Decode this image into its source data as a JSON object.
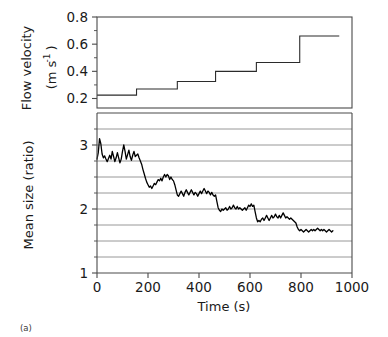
{
  "figure": {
    "caption": "(a)",
    "background_color": "#ffffff",
    "line_color": "#2b2b2b",
    "grid_color": "#8c8c8c",
    "axis_color": "#4a4a4a"
  },
  "chart_data": [
    {
      "type": "line",
      "id": "flow-velocity-panel",
      "title": "",
      "xlabel": "",
      "ylabel": "Flow velocity (m s⁻¹)",
      "ylabel_line1": "Flow velocity",
      "ylabel_line2": "(m s",
      "ylabel_exponent": "-1",
      "ylabel_line2_close": ")",
      "ytick_labels": [
        "0.2",
        "0.4",
        "0.6",
        "0.8"
      ],
      "ytick_values": [
        0.2,
        0.4,
        0.6,
        0.8
      ],
      "ylim": [
        0.13,
        0.8
      ],
      "xlim": [
        0,
        1000
      ],
      "grid": false,
      "step_style": "post",
      "x": [
        0,
        155,
        155,
        315,
        315,
        465,
        465,
        625,
        625,
        795,
        795,
        950
      ],
      "y": [
        0.225,
        0.225,
        0.27,
        0.27,
        0.325,
        0.325,
        0.4,
        0.4,
        0.465,
        0.465,
        0.66,
        0.66
      ],
      "steps": [
        {
          "x_start": 0,
          "x_end": 155,
          "velocity": 0.225
        },
        {
          "x_start": 155,
          "x_end": 315,
          "velocity": 0.27
        },
        {
          "x_start": 315,
          "x_end": 465,
          "velocity": 0.325
        },
        {
          "x_start": 465,
          "x_end": 625,
          "velocity": 0.4
        },
        {
          "x_start": 625,
          "x_end": 795,
          "velocity": 0.465
        },
        {
          "x_start": 795,
          "x_end": 950,
          "velocity": 0.66
        }
      ]
    },
    {
      "type": "line",
      "id": "mean-size-panel",
      "title": "",
      "xlabel": "Time (s)",
      "ylabel": "Mean size (ratio)",
      "ytick_labels": [
        "1",
        "2",
        "3"
      ],
      "ytick_values": [
        1,
        2,
        3
      ],
      "xtick_labels": [
        "0",
        "200",
        "400",
        "600",
        "800",
        "1000"
      ],
      "xtick_values": [
        0,
        200,
        400,
        600,
        800,
        1000
      ],
      "ylim": [
        1.0,
        3.5
      ],
      "xlim": [
        0,
        1000
      ],
      "grid": true,
      "grid_values": [
        1.25,
        1.5,
        1.75,
        2.0,
        2.25,
        2.5,
        2.75,
        3.0,
        3.25,
        3.5
      ],
      "x": [
        0,
        5,
        10,
        15,
        20,
        25,
        30,
        35,
        40,
        45,
        50,
        55,
        60,
        65,
        70,
        75,
        80,
        85,
        90,
        95,
        100,
        105,
        110,
        115,
        120,
        125,
        130,
        135,
        140,
        145,
        150,
        155,
        160,
        165,
        170,
        175,
        180,
        185,
        190,
        195,
        200,
        205,
        210,
        215,
        220,
        225,
        230,
        235,
        240,
        245,
        250,
        255,
        260,
        265,
        270,
        275,
        280,
        285,
        290,
        295,
        300,
        305,
        310,
        315,
        320,
        325,
        330,
        335,
        340,
        345,
        350,
        355,
        360,
        365,
        370,
        375,
        380,
        385,
        390,
        395,
        400,
        405,
        410,
        415,
        420,
        425,
        430,
        435,
        440,
        445,
        450,
        455,
        460,
        465,
        470,
        475,
        480,
        485,
        490,
        495,
        500,
        505,
        510,
        515,
        520,
        525,
        530,
        535,
        540,
        545,
        550,
        555,
        560,
        565,
        570,
        575,
        580,
        585,
        590,
        595,
        600,
        605,
        610,
        615,
        620,
        625,
        630,
        635,
        640,
        645,
        650,
        655,
        660,
        665,
        670,
        675,
        680,
        685,
        690,
        695,
        700,
        705,
        710,
        715,
        720,
        725,
        730,
        735,
        740,
        745,
        750,
        755,
        760,
        765,
        770,
        775,
        780,
        785,
        790,
        795,
        800,
        805,
        810,
        815,
        820,
        825,
        830,
        835,
        840,
        845,
        850,
        855,
        860,
        865,
        870,
        875,
        880,
        885,
        890,
        895,
        900,
        905,
        910,
        915,
        920,
        925,
        930,
        935,
        940,
        945,
        950
      ],
      "y": [
        2.78,
        2.88,
        3.1,
        3.02,
        2.86,
        2.8,
        2.83,
        2.78,
        2.74,
        2.79,
        2.84,
        2.78,
        2.9,
        2.82,
        2.74,
        2.8,
        2.88,
        2.8,
        2.72,
        2.78,
        2.9,
        3.0,
        2.9,
        2.78,
        2.85,
        2.92,
        2.82,
        2.76,
        2.84,
        2.9,
        2.82,
        2.84,
        2.86,
        2.8,
        2.75,
        2.7,
        2.62,
        2.55,
        2.48,
        2.42,
        2.38,
        2.34,
        2.36,
        2.32,
        2.36,
        2.4,
        2.38,
        2.42,
        2.46,
        2.44,
        2.48,
        2.44,
        2.5,
        2.54,
        2.5,
        2.54,
        2.52,
        2.46,
        2.5,
        2.46,
        2.44,
        2.38,
        2.3,
        2.22,
        2.2,
        2.24,
        2.28,
        2.24,
        2.2,
        2.26,
        2.3,
        2.26,
        2.22,
        2.26,
        2.3,
        2.26,
        2.22,
        2.26,
        2.24,
        2.2,
        2.24,
        2.28,
        2.24,
        2.28,
        2.32,
        2.28,
        2.24,
        2.28,
        2.26,
        2.22,
        2.26,
        2.22,
        2.2,
        2.22,
        2.12,
        2.02,
        1.98,
        1.96,
        2.0,
        1.98,
        2.0,
        2.02,
        1.98,
        2.0,
        2.04,
        2.0,
        2.02,
        2.06,
        2.02,
        2.0,
        2.04,
        2.0,
        2.02,
        2.0,
        1.98,
        2.0,
        2.02,
        1.98,
        2.02,
        2.06,
        2.04,
        2.08,
        2.04,
        2.06,
        1.96,
        1.86,
        1.8,
        1.82,
        1.8,
        1.84,
        1.86,
        1.82,
        1.86,
        1.9,
        1.86,
        1.82,
        1.86,
        1.9,
        1.86,
        1.88,
        1.92,
        1.88,
        1.86,
        1.9,
        1.86,
        1.9,
        1.94,
        1.9,
        1.86,
        1.88,
        1.86,
        1.84,
        1.86,
        1.84,
        1.82,
        1.8,
        1.78,
        1.72,
        1.68,
        1.66,
        1.68,
        1.66,
        1.64,
        1.66,
        1.68,
        1.66,
        1.64,
        1.66,
        1.68,
        1.66,
        1.68,
        1.66,
        1.68,
        1.7,
        1.68,
        1.66,
        1.68,
        1.66,
        1.68,
        1.66,
        1.64,
        1.66,
        1.68,
        1.66,
        1.64,
        1.66
      ]
    }
  ]
}
